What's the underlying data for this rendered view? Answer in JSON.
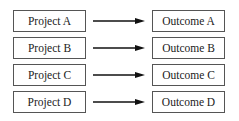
{
  "diagram": {
    "rows": [
      {
        "project": "Project A",
        "outcome": "Outcome A"
      },
      {
        "project": "Project B",
        "outcome": "Outcome B"
      },
      {
        "project": "Project C",
        "outcome": "Outcome C"
      },
      {
        "project": "Project D",
        "outcome": "Outcome D"
      }
    ],
    "colors": {
      "border": "#555555",
      "arrow": "#111111",
      "text": "#222222"
    }
  }
}
